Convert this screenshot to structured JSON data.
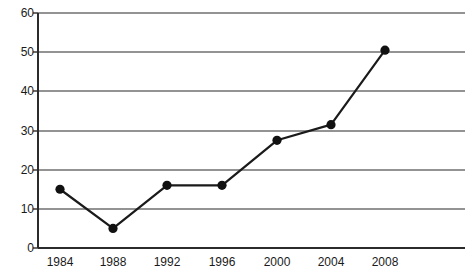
{
  "chart_data": {
    "type": "line",
    "title": "",
    "subtitle": "",
    "xlabel": "",
    "ylabel": "",
    "categories": [
      "1984",
      "1988",
      "1992",
      "1996",
      "2000",
      "2004",
      "2008"
    ],
    "x": [
      1984,
      1988,
      1992,
      1996,
      2000,
      2004,
      2008
    ],
    "values": [
      15,
      5,
      16,
      16,
      27.5,
      31.5,
      50.5
    ],
    "series": [
      {
        "name": "",
        "values": [
          15,
          5,
          16,
          16,
          27.5,
          31.5,
          50.5
        ]
      }
    ],
    "ylim": [
      0,
      60
    ],
    "ytick_labels": [
      "0",
      "10",
      "20",
      "30",
      "40",
      "50",
      "60"
    ],
    "yticks": [
      0,
      10,
      20,
      30,
      40,
      50,
      60
    ],
    "xtick_labels": [
      "1984",
      "1988",
      "1992",
      "1996",
      "2000",
      "2004",
      "2008"
    ],
    "grid": "horizontal",
    "legend": "none",
    "marker": "filled-circle",
    "colors": {
      "line": "#1a1a1a",
      "marker": "#111111",
      "grid": "#808080",
      "axis": "#333333",
      "background": "#ffffff",
      "text": "#1a1a1a"
    }
  },
  "axes": {
    "y_labels": [
      "60",
      "50",
      "40",
      "30",
      "20",
      "10",
      "0"
    ],
    "x_labels": [
      "1984",
      "1988",
      "1992",
      "1996",
      "2000",
      "2004",
      "2008"
    ]
  }
}
